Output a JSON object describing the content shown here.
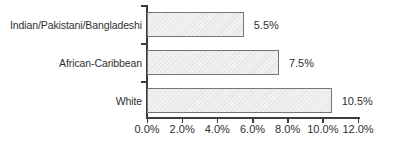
{
  "chart_data": {
    "type": "bar",
    "orientation": "horizontal",
    "title": "",
    "xlabel": "",
    "ylabel": "",
    "categories": [
      "Indian/Pakistani/Bangladeshi",
      "African-Caribbean",
      "White"
    ],
    "values": [
      5.5,
      7.5,
      10.5
    ],
    "value_labels": [
      "5.5%",
      "7.5%",
      "10.5%"
    ],
    "xlim": [
      0,
      12
    ],
    "x_tick_values": [
      0,
      2,
      4,
      6,
      8,
      10,
      12
    ],
    "x_tick_labels": [
      "0.0%",
      "2.0%",
      "4.0%",
      "6.0%",
      "8.0%",
      "10.0%",
      "12.0%"
    ],
    "grid": false,
    "legend": false,
    "colors": {
      "bar_fill": "#f2f2f2",
      "bar_hatch": "#e4e4e4",
      "bar_border": "#757575",
      "axis": "#3d3d3d",
      "text": "#2f2f2f",
      "background": "#ffffff"
    }
  }
}
